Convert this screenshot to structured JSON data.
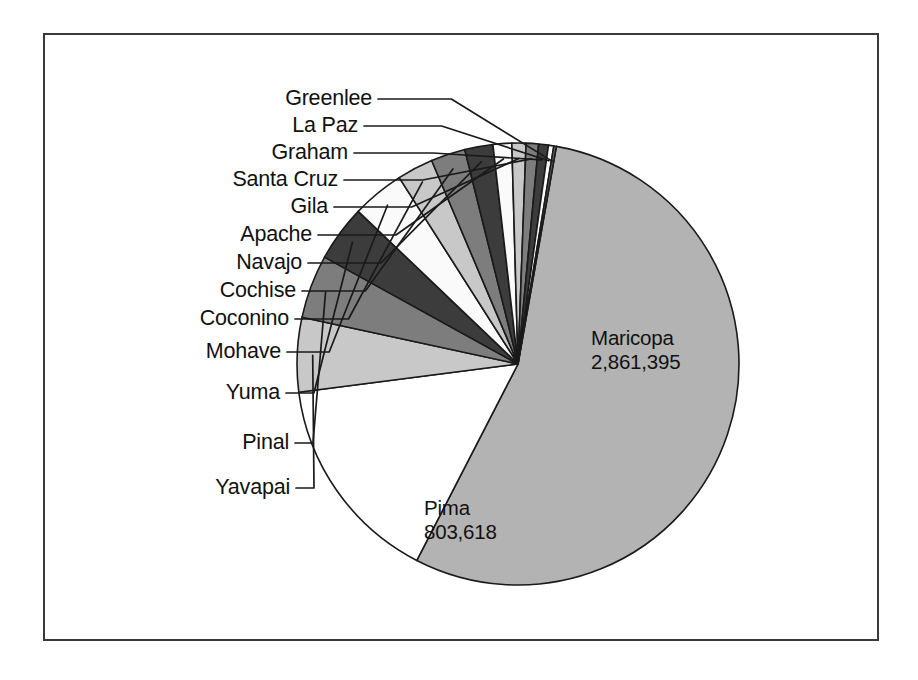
{
  "figure": {
    "background": "#ffffff",
    "frame_color": "#3a3a3c",
    "outline_color": "#1a1a1a"
  },
  "chart_data": {
    "type": "pie",
    "title": "",
    "subtitle": "",
    "xlabel": "",
    "ylabel": "",
    "legend_position": "none",
    "grid": false,
    "label_style": "leader-lines-left",
    "total": 6392017,
    "categories": [
      "Maricopa",
      "Pima",
      "Yavapai",
      "Pinal",
      "Yuma",
      "Mohave",
      "Coconino",
      "Cochise",
      "Navajo",
      "Apache",
      "Gila",
      "Santa Cruz",
      "Graham",
      "La Paz",
      "Greenlee"
    ],
    "values": [
      2861395,
      803618,
      283550,
      242827,
      214208,
      200186,
      138064,
      131346,
      107449,
      71518,
      53597,
      47420,
      37220,
      20489,
      9540
    ],
    "labels_shown_inline": [
      {
        "name": "Maricopa",
        "value": "2,861,395"
      },
      {
        "name": "Pima",
        "value": "803,618"
      }
    ],
    "slices": [
      {
        "label": "Maricopa",
        "value": 2861395,
        "value_text": "2,861,395",
        "fill": "#b3b3b3",
        "label_mode": "inline"
      },
      {
        "label": "Pima",
        "value": 803618,
        "value_text": "803,618",
        "fill": "#ffffff",
        "label_mode": "inline"
      },
      {
        "label": "Yavapai",
        "value": 283550,
        "value_text": "",
        "fill": "#c8c8c8",
        "label_mode": "leader"
      },
      {
        "label": "Pinal",
        "value": 242827,
        "value_text": "",
        "fill": "#7d7d7d",
        "label_mode": "leader"
      },
      {
        "label": "Yuma",
        "value": 214208,
        "value_text": "",
        "fill": "#3c3c3c",
        "label_mode": "leader"
      },
      {
        "label": "Mohave",
        "value": 200186,
        "value_text": "",
        "fill": "#fafafa",
        "label_mode": "leader"
      },
      {
        "label": "Coconino",
        "value": 138064,
        "value_text": "",
        "fill": "#c8c8c8",
        "label_mode": "leader"
      },
      {
        "label": "Cochise",
        "value": 131346,
        "value_text": "",
        "fill": "#7d7d7d",
        "label_mode": "leader"
      },
      {
        "label": "Navajo",
        "value": 107449,
        "value_text": "",
        "fill": "#3c3c3c",
        "label_mode": "leader"
      },
      {
        "label": "Apache",
        "value": 71518,
        "value_text": "",
        "fill": "#fafafa",
        "label_mode": "leader"
      },
      {
        "label": "Gila",
        "value": 53597,
        "value_text": "",
        "fill": "#c8c8c8",
        "label_mode": "leader"
      },
      {
        "label": "Santa Cruz",
        "value": 47420,
        "value_text": "",
        "fill": "#7d7d7d",
        "label_mode": "leader"
      },
      {
        "label": "Graham",
        "value": 37220,
        "value_text": "",
        "fill": "#3c3c3c",
        "label_mode": "leader"
      },
      {
        "label": "La Paz",
        "value": 20489,
        "value_text": "",
        "fill": "#fafafa",
        "label_mode": "leader"
      },
      {
        "label": "Greenlee",
        "value": 9540,
        "value_text": "",
        "fill": "#6e6e6e",
        "label_mode": "leader"
      }
    ]
  },
  "callouts": [
    {
      "name": "Greenlee",
      "label": "Greenlee",
      "text_right": 372,
      "text_top": 88
    },
    {
      "name": "La Paz",
      "label": "La Paz",
      "text_right": 358,
      "text_top": 115
    },
    {
      "name": "Graham",
      "label": "Graham",
      "text_right": 348,
      "text_top": 142
    },
    {
      "name": "Santa Cruz",
      "label": "Santa Cruz",
      "text_right": 338,
      "text_top": 169
    },
    {
      "name": "Gila",
      "label": "Gila",
      "text_right": 328,
      "text_top": 196
    },
    {
      "name": "Apache",
      "label": "Apache",
      "text_right": 312,
      "text_top": 224
    },
    {
      "name": "Navajo",
      "label": "Navajo",
      "text_right": 302,
      "text_top": 252
    },
    {
      "name": "Cochise",
      "label": "Cochise",
      "text_right": 296,
      "text_top": 280
    },
    {
      "name": "Coconino",
      "label": "Coconino",
      "text_right": 289,
      "text_top": 308
    },
    {
      "name": "Mohave",
      "label": "Mohave",
      "text_right": 281,
      "text_top": 341
    },
    {
      "name": "Yuma",
      "label": "Yuma",
      "text_right": 280,
      "text_top": 382
    },
    {
      "name": "Pinal",
      "label": "Pinal",
      "text_right": 289,
      "text_top": 432
    },
    {
      "name": "Yavapai",
      "label": "Yavapai",
      "text_right": 290,
      "text_top": 477
    }
  ],
  "inline_labels": [
    {
      "name": "Maricopa",
      "label": "Maricopa",
      "value_text": "2,861,395",
      "left": 591,
      "top": 326
    },
    {
      "name": "Pima",
      "label": "Pima",
      "value_text": "803,618",
      "left": 424,
      "top": 496
    }
  ]
}
